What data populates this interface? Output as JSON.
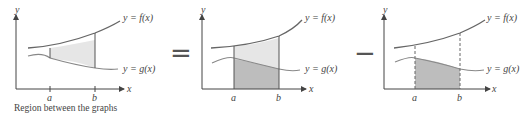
{
  "caption": "Region between the graphs",
  "panels": [
    {
      "f_label": "y = f(x)",
      "g_label": "y = g(x)",
      "x_axis": "x",
      "y_axis": "y",
      "a": "a",
      "b": "b"
    },
    {
      "f_label": "y = f(x)",
      "g_label": "y = g(x)",
      "x_axis": "x",
      "y_axis": "y",
      "a": "a",
      "b": "b"
    },
    {
      "f_label": "y = f(x)",
      "g_label": "y = g(x)",
      "x_axis": "x",
      "y_axis": "y",
      "a": "a",
      "b": "b"
    }
  ],
  "operators": {
    "equals": "=",
    "minus": "−"
  },
  "colors": {
    "curve": "#555555",
    "light_fill": "#e6e6e6",
    "dark_fill": "#bdbdbd"
  }
}
